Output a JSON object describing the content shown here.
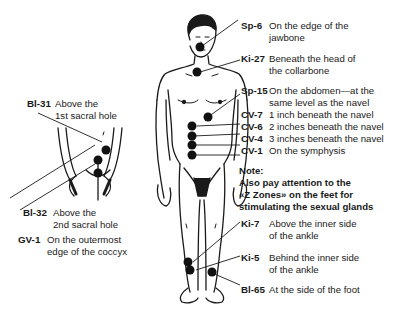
{
  "points": [
    {
      "code": "Sp-6",
      "line1": "On the edge of the",
      "line2": "jawbone"
    },
    {
      "code": "Ki-27",
      "line1": "Beneath the head of",
      "line2": "the collarbone"
    },
    {
      "code": "Sp-15",
      "line1": "On the abdomen—at the",
      "line2": "same level as the navel"
    },
    {
      "code": "CV-7",
      "line1": "1 inch beneath the navel"
    },
    {
      "code": "CV-6",
      "line1": "2 inches beneath the navel"
    },
    {
      "code": "CV-4",
      "line1": "3 inches beneath the navel"
    },
    {
      "code": "CV-1",
      "line1": "On the symphysis"
    },
    {
      "code": "Ki-7",
      "line1": "Above the inner side",
      "line2": "of the ankle"
    },
    {
      "code": "Ki-5",
      "line1": "Behind the inner side",
      "line2": "of the ankle"
    },
    {
      "code": "Bl-65",
      "line1": "At the side of the foot"
    },
    {
      "code": "Bl-31",
      "line1": "Above the",
      "line2": "1st sacral hole"
    },
    {
      "code": "Bl-32",
      "line1": "Above the",
      "line2": "2nd sacral hole"
    },
    {
      "code": "GV-1",
      "line1": "On the outermost",
      "line2": "edge of the coccyx"
    }
  ],
  "note": {
    "title": "Note:",
    "line1": "Also pay attention to the",
    "line2": "«Z Zones» on the feet for",
    "line3": "stimulating the sexual glands"
  },
  "colors": {
    "ink": "#1a1a1a",
    "point": "#111111",
    "background": "#ffffff"
  }
}
